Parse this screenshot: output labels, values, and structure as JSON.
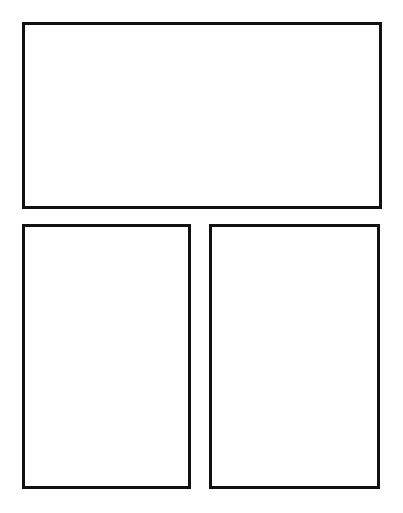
{
  "page": {
    "type": "comic-page-template",
    "background_color": "#ffffff",
    "border_color": "#111111"
  },
  "panels": [
    {
      "id": "top-wide-panel",
      "label": "",
      "x": 22,
      "y": 22,
      "width": 360,
      "height": 187
    },
    {
      "id": "bottom-left-panel",
      "label": "",
      "x": 22,
      "y": 224,
      "width": 169,
      "height": 265
    },
    {
      "id": "bottom-right-panel",
      "label": "",
      "x": 209,
      "y": 224,
      "width": 171,
      "height": 265
    }
  ]
}
